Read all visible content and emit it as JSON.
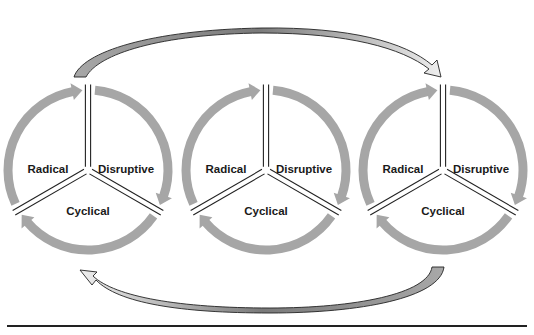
{
  "diagram": {
    "type": "innovation-cycle-sequence",
    "colors": {
      "ring": "#a6a6a6",
      "divider": "#222222",
      "connector_fill_tail": "#a8a8a8",
      "connector_fill_head": "#eeeeee",
      "connector_outline": "#222222",
      "rule": "#222222",
      "label": "#1a1a1a"
    },
    "cycles": [
      {
        "id": "cycle-1",
        "segments": [
          {
            "label": "Radical",
            "position": "upper-left",
            "arrow_icon": "clockwise-arrow-icon"
          },
          {
            "label": "Disruptive",
            "position": "upper-right",
            "arrow_icon": "clockwise-arrow-icon"
          },
          {
            "label": "Cyclical",
            "position": "bottom",
            "arrow_icon": "clockwise-arrow-icon"
          }
        ]
      },
      {
        "id": "cycle-2",
        "segments": [
          {
            "label": "Radical",
            "position": "upper-left",
            "arrow_icon": "clockwise-arrow-icon"
          },
          {
            "label": "Disruptive",
            "position": "upper-right",
            "arrow_icon": "clockwise-arrow-icon"
          },
          {
            "label": "Cyclical",
            "position": "bottom",
            "arrow_icon": "clockwise-arrow-icon"
          }
        ]
      },
      {
        "id": "cycle-3",
        "segments": [
          {
            "label": "Radical",
            "position": "upper-left",
            "arrow_icon": "clockwise-arrow-icon"
          },
          {
            "label": "Disruptive",
            "position": "upper-right",
            "arrow_icon": "clockwise-arrow-icon"
          },
          {
            "label": "Cyclical",
            "position": "bottom",
            "arrow_icon": "clockwise-arrow-icon"
          }
        ]
      }
    ],
    "connectors": [
      {
        "name": "top-curved-arrow",
        "from": "cycle-1",
        "to": "cycle-3",
        "direction": "left-to-right",
        "icon": "curved-arrow-icon"
      },
      {
        "name": "bottom-curved-arrow",
        "from": "cycle-3",
        "to": "cycle-1",
        "direction": "right-to-left",
        "icon": "curved-arrow-icon"
      }
    ]
  }
}
